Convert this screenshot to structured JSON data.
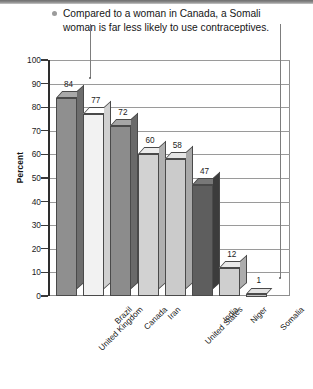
{
  "caption": {
    "bullet_icon": "bullet-dot-icon",
    "line1": "Compared to a woman in Canada, a Somali",
    "line2": "woman is far less likely to use contraceptives."
  },
  "chart_data": {
    "type": "bar",
    "title": "Compared to a woman in Canada, a Somali woman is far less likely to use contraceptives.",
    "xlabel": "",
    "ylabel": "Percent",
    "ylim": [
      0,
      100
    ],
    "ytick_step": 10,
    "grid": true,
    "legend": "none",
    "style": "3d-bars",
    "categories": [
      "United Kingdom",
      "Brazil",
      "Canada",
      "Iran",
      "United States",
      "India",
      "Niger",
      "Somalia"
    ],
    "values": [
      84,
      77,
      72,
      60,
      58,
      47,
      12,
      1
    ],
    "value_labels": [
      "84",
      "77",
      "72",
      "60",
      "58",
      "47",
      "12",
      "1"
    ],
    "bar_colors": [
      "#8f8f8f",
      "#f2f2f2",
      "#8c8c8c",
      "#d2d2d2",
      "#cbcbcb",
      "#5e5e5e",
      "#cfcfcf",
      "#e2e2e2"
    ],
    "ytick_labels": [
      "100",
      "90",
      "80",
      "70",
      "60",
      "50",
      "40",
      "30",
      "20",
      "10",
      "0"
    ],
    "annotations": [
      {
        "name": "leader-to-united-kingdom",
        "target": "United Kingdom",
        "value": 84
      },
      {
        "name": "leader-to-somalia",
        "target": "Somalia",
        "value": 1
      }
    ]
  },
  "colors": {
    "axis": "#2e2e2e",
    "grid": "#9a9a9a",
    "text": "#161616",
    "bullet": "#9b9b9b",
    "leader": "#7d7d7d"
  }
}
